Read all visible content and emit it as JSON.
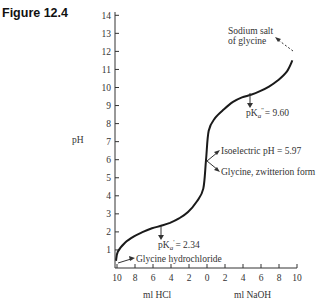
{
  "figure_label": "Figure 12.4",
  "chart_data": {
    "type": "line",
    "ylabel": "pH",
    "xlabel_left": "ml HCl",
    "xlabel_right": "ml NaOH",
    "ylim": [
      0,
      14
    ],
    "yticks": [
      1,
      2,
      3,
      4,
      5,
      6,
      7,
      8,
      9,
      10,
      11,
      12,
      13,
      14
    ],
    "xticks": [
      "10",
      "8",
      "6",
      "4",
      "2",
      "0",
      "2",
      "4",
      "6",
      "8",
      "10"
    ],
    "grid": false,
    "series": [
      {
        "name": "glycine titration",
        "x_note": "x from -10 (10 ml HCl) to +10 (10 ml NaOH)",
        "points": [
          [
            -10,
            0.4
          ],
          [
            -9.8,
            0.9
          ],
          [
            -9,
            1.4
          ],
          [
            -8,
            1.75
          ],
          [
            -7,
            2.0
          ],
          [
            -6,
            2.2
          ],
          [
            -5,
            2.34
          ],
          [
            -4,
            2.5
          ],
          [
            -3,
            2.75
          ],
          [
            -2,
            3.1
          ],
          [
            -1,
            3.7
          ],
          [
            -0.3,
            4.4
          ],
          [
            0,
            5.97
          ],
          [
            0.3,
            7.6
          ],
          [
            1,
            8.3
          ],
          [
            2,
            8.8
          ],
          [
            3,
            9.2
          ],
          [
            4,
            9.45
          ],
          [
            5,
            9.6
          ],
          [
            6,
            9.8
          ],
          [
            7,
            10.05
          ],
          [
            8,
            10.4
          ],
          [
            9,
            10.9
          ],
          [
            9.6,
            11.5
          ]
        ]
      }
    ],
    "annotations": [
      {
        "text": "Sodium salt",
        "line2": "of glycine"
      },
      {
        "text_prefix": "pK",
        "sub": "a",
        "sup": "''",
        "value": "= 9.60"
      },
      {
        "text": "Isoelectric pH = 5.97"
      },
      {
        "text": "Glycine, zwitterion form"
      },
      {
        "text_prefix": "pK",
        "sub": "a",
        "sup": "'",
        "value": "= 2.34"
      },
      {
        "text": "Glycine hydrochloride"
      }
    ]
  },
  "labels": {
    "ph": "pH",
    "ml_hcl": "ml HCl",
    "ml_naoh": "ml NaOH",
    "sodium_salt_1": "Sodium salt",
    "sodium_salt_2": "of glycine",
    "pka2_value": "= 9.60",
    "isoelectric": "Isoelectric pH = 5.97",
    "zwitterion": "Glycine, zwitterion form",
    "pka1_value": "= 2.34",
    "hydrochloride": "Glycine hydrochloride",
    "pk": "pK",
    "sub_a": "a"
  }
}
